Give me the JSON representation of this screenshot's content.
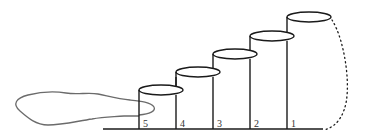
{
  "diagram": {
    "colors": {
      "stroke": "#1a1a1a",
      "blob": "#6b6b6b",
      "label": "#333333"
    },
    "baseline": {
      "x1": 103,
      "x2": 323,
      "y": 129
    },
    "cylinders": [
      {
        "label": "5",
        "x": 139,
        "top_y": 90,
        "label_x": 143,
        "label_y": 127
      },
      {
        "label": "4",
        "x": 176,
        "top_y": 72,
        "label_x": 180,
        "label_y": 127
      },
      {
        "label": "3",
        "x": 213,
        "top_y": 54,
        "label_x": 217,
        "label_y": 127
      },
      {
        "label": "2",
        "x": 250,
        "top_y": 36,
        "label_x": 254,
        "label_y": 127
      },
      {
        "label": "1",
        "x": 287,
        "top_y": 17,
        "label_x": 291,
        "label_y": 127
      }
    ],
    "cylinder_width": 44,
    "ellipse_ry": 5
  }
}
